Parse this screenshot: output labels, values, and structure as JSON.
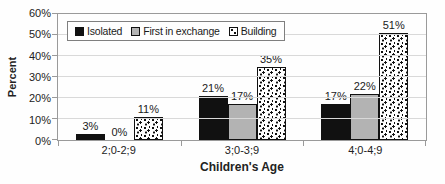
{
  "chart_data": {
    "type": "bar",
    "title": "",
    "categories": [
      "2;0-2;9",
      "3;0-3;9",
      "4;0-4;9"
    ],
    "series": [
      {
        "name": "Isolated",
        "values": [
          3,
          21,
          17
        ],
        "data_labels": [
          "3%",
          "21%",
          "17%"
        ],
        "fill": "#111111",
        "pattern": "solid"
      },
      {
        "name": "First in exchange",
        "values": [
          0,
          17,
          22
        ],
        "data_labels": [
          "0%",
          "17%",
          "22%"
        ],
        "fill": "#b3b3b3",
        "pattern": "solid"
      },
      {
        "name": "Building",
        "values": [
          11,
          35,
          51
        ],
        "data_labels": [
          "11%",
          "35%",
          "51%"
        ],
        "fill": "#ffffff",
        "pattern": "speckle"
      }
    ],
    "xlabel": "Children's Age",
    "ylabel": "Percent",
    "ylim": [
      0,
      60
    ],
    "ytick_step": 10,
    "ytick_labels": [
      "0%",
      "10%",
      "20%",
      "30%",
      "40%",
      "50%",
      "60%"
    ],
    "grid": true,
    "legend_position": "top-left-inside"
  },
  "colors": {
    "bar_black": "#111111",
    "bar_gray": "#b3b3b3",
    "pattern_background": "#ffffff",
    "grid_line": "#d9d9d9",
    "axis_line": "#9a9a9a",
    "legend_border": "#7f7f7f",
    "text": "#1a1a1a",
    "background": "#fefefe"
  }
}
